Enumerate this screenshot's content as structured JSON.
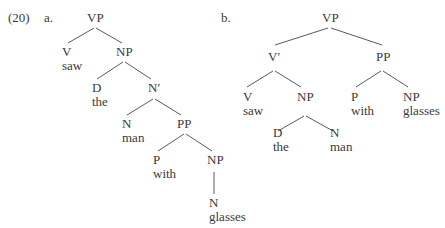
{
  "example": {
    "number": "(20)",
    "a": {
      "label": "a.",
      "nodes": {
        "vp": "VP",
        "v": "V",
        "v_word": "saw",
        "np": "NP",
        "d": "D",
        "d_word": "the",
        "nbar": "N′",
        "n": "N",
        "n_word": "man",
        "pp": "PP",
        "p": "P",
        "p_word": "with",
        "np2": "NP",
        "n2": "N",
        "n2_word": "glasses"
      }
    },
    "b": {
      "label": "b.",
      "nodes": {
        "vp": "VP",
        "vbar": "V′",
        "pp": "PP",
        "v": "V",
        "v_word": "saw",
        "np": "NP",
        "p": "P",
        "p_word": "with",
        "np2": "NP",
        "np2_word": "glasses",
        "d": "D",
        "d_word": "the",
        "n": "N",
        "n_word": "man"
      }
    }
  }
}
